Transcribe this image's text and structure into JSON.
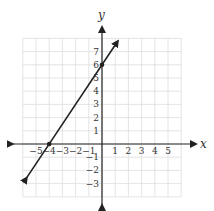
{
  "chart_data": {
    "type": "line",
    "title": "",
    "xlabel": "x",
    "ylabel": "y",
    "xlim": [
      -6,
      6
    ],
    "ylim": [
      -4,
      8
    ],
    "grid": true,
    "x_ticks": [
      "-5",
      "-4",
      "-3",
      "-2",
      "-1",
      "1",
      "2",
      "3",
      "4",
      "5"
    ],
    "y_ticks": [
      "7",
      "6",
      "5",
      "4",
      "3",
      "2",
      "1",
      "-1",
      "-2",
      "-3"
    ],
    "series": [
      {
        "name": "line",
        "equation": "y = 1.5x + 6",
        "x": [
          -5.7,
          1.2
        ],
        "y": [
          -2.55,
          7.8
        ]
      }
    ],
    "points": [
      {
        "x": -4,
        "y": 0,
        "label": "x-intercept"
      },
      {
        "x": 0,
        "y": 6,
        "label": "y-intercept"
      }
    ]
  }
}
